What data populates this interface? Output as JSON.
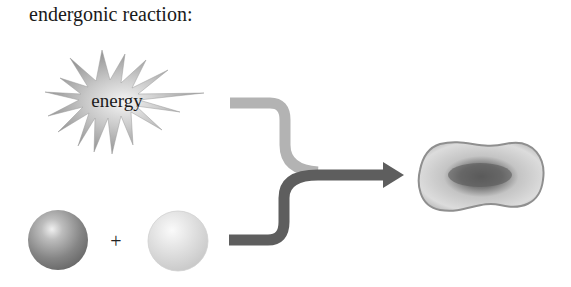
{
  "title": "endergonic reaction:",
  "diagram": {
    "energy_label": "energy",
    "plus_sign": "+",
    "elements": [
      {
        "name": "energy-burst",
        "label": "energy"
      },
      {
        "name": "reactant-sphere-dark"
      },
      {
        "name": "reactant-sphere-light"
      },
      {
        "name": "input-arrow-energy",
        "color": "#b3b3b3"
      },
      {
        "name": "input-arrow-reactants",
        "color": "#5f5f5f"
      },
      {
        "name": "product-molecule"
      }
    ]
  },
  "colors": {
    "light_arrow": "#b3b3b3",
    "dark_arrow": "#5e5e5e",
    "background": "#ffffff"
  }
}
